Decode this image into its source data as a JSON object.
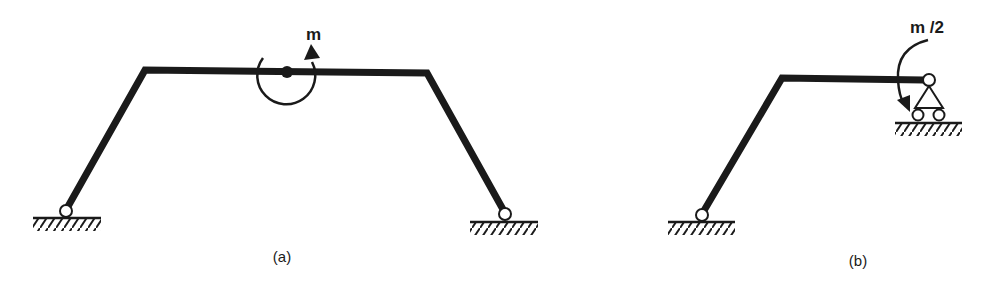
{
  "figures": [
    {
      "id": "a",
      "caption": "(a)",
      "moment_label": "m",
      "description": "Symmetric trapezoidal portal frame pinned at both bases with a hinge at mid-span of the beam carrying a counter-clockwise applied moment m"
    },
    {
      "id": "b",
      "caption": "(b)",
      "moment_label": "m /2",
      "description": "Half-frame: inclined column pinned at base, horizontal beam ending at a roller support with applied clockwise moment m/2"
    }
  ],
  "colors": {
    "stroke": "#1a1a1a",
    "background": "#ffffff"
  }
}
